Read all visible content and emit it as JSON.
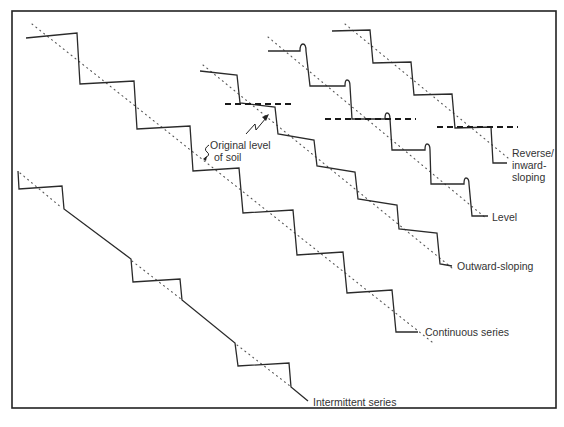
{
  "diagram": {
    "labels": {
      "original_level_line1": "Original level",
      "original_level_line2": "of soil",
      "reverse_line1": "Reverse/",
      "reverse_line2": "inward-",
      "reverse_line3": "sloping",
      "level": "Level",
      "outward": "Outward-sloping",
      "continuous": "Continuous series",
      "intermittent": "Intermittent series"
    },
    "series": [
      {
        "id": "continuous",
        "name": "Continuous series"
      },
      {
        "id": "intermittent",
        "name": "Intermittent series"
      },
      {
        "id": "outward",
        "name": "Outward-sloping"
      },
      {
        "id": "level",
        "name": "Level"
      },
      {
        "id": "reverse",
        "name": "Reverse/inward-sloping"
      }
    ],
    "colors": {
      "line": "#2a2a2a",
      "background": "#ffffff"
    }
  }
}
